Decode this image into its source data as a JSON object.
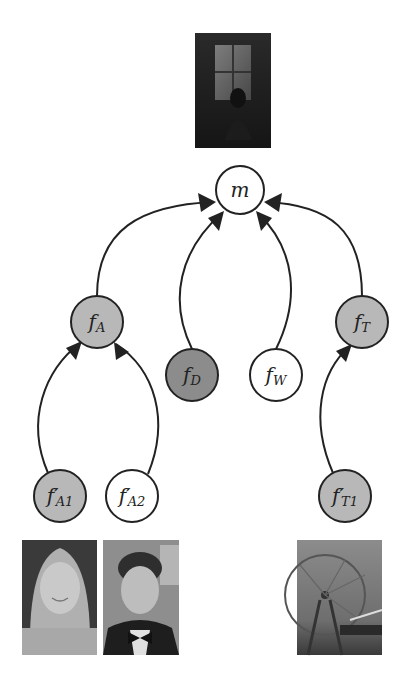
{
  "diagram": {
    "type": "tree-graphical-model",
    "colors": {
      "node_stroke": "#222222",
      "edge": "#222222",
      "node_white": "#ffffff",
      "node_light_gray": "#b8b8b8",
      "node_dark_gray": "#8c8c8c"
    },
    "nodes": [
      {
        "id": "m",
        "label": "m",
        "sub": "",
        "prime": false,
        "cx": 240,
        "cy": 190,
        "r": 24,
        "fill": "#ffffff"
      },
      {
        "id": "fA",
        "label": "f",
        "sub": "A",
        "prime": false,
        "cx": 97,
        "cy": 322,
        "r": 26,
        "fill": "#b8b8b8"
      },
      {
        "id": "fD",
        "label": "f",
        "sub": "D",
        "prime": false,
        "cx": 192,
        "cy": 375,
        "r": 26,
        "fill": "#8c8c8c"
      },
      {
        "id": "fW",
        "label": "f",
        "sub": "W",
        "prime": false,
        "cx": 276,
        "cy": 375,
        "r": 26,
        "fill": "#ffffff"
      },
      {
        "id": "fT",
        "label": "f",
        "sub": "T",
        "prime": false,
        "cx": 362,
        "cy": 322,
        "r": 26,
        "fill": "#b8b8b8"
      },
      {
        "id": "fA1",
        "label": "f",
        "sub": "A1",
        "prime": true,
        "cx": 60,
        "cy": 496,
        "r": 26,
        "fill": "#b8b8b8"
      },
      {
        "id": "fA2",
        "label": "f",
        "sub": "A2",
        "prime": true,
        "cx": 132,
        "cy": 496,
        "r": 26,
        "fill": "#ffffff"
      },
      {
        "id": "fT1",
        "label": "f",
        "sub": "T1",
        "prime": true,
        "cx": 345,
        "cy": 496,
        "r": 26,
        "fill": "#b8b8b8"
      }
    ],
    "edges": [
      {
        "from": "fA",
        "to": "m",
        "path": "M 97 296 C 97 230, 140 205, 214 202",
        "arrow": [
          216,
          202,
          198,
          193,
          201,
          212
        ]
      },
      {
        "from": "fD",
        "to": "m",
        "path": "M 192 349 C 168 300, 180 250, 222 213",
        "arrow": [
          224,
          211,
          208,
          218,
          219,
          231
        ]
      },
      {
        "from": "fW",
        "to": "m",
        "path": "M 276 349 C 300 300, 296 250, 258 213",
        "arrow": [
          256,
          211,
          261,
          231,
          272,
          218
        ]
      },
      {
        "from": "fT",
        "to": "m",
        "path": "M 362 296 C 362 230, 330 205, 266 202",
        "arrow": [
          264,
          202,
          279,
          212,
          282,
          193
        ]
      },
      {
        "from": "fA1",
        "to": "fA",
        "path": "M 48 473 C 25 420, 45 370, 80 343",
        "arrow": [
          82,
          341,
          66,
          348,
          76,
          360
        ]
      },
      {
        "from": "fA2",
        "to": "fA",
        "path": "M 148 474 C 170 420, 155 370, 116 344",
        "arrow": [
          114,
          342,
          116,
          360,
          129,
          352
        ]
      },
      {
        "from": "fT1",
        "to": "fT",
        "path": "M 333 473 C 310 420, 320 372, 350 346",
        "arrow": [
          352,
          344,
          336,
          351,
          346,
          362
        ]
      }
    ],
    "images": [
      {
        "id": "movie-poster",
        "caption": "movie poster (woman seated by a window)",
        "x": 195,
        "y": 33,
        "w": 76,
        "h": 115,
        "tone": "dark"
      },
      {
        "id": "actress-photo",
        "caption": "photo of actress",
        "x": 22,
        "y": 540,
        "w": 75,
        "h": 115,
        "tone": "light"
      },
      {
        "id": "actor-photo",
        "caption": "photo of actor in tuxedo",
        "x": 103,
        "y": 540,
        "w": 76,
        "h": 115,
        "tone": "mid"
      },
      {
        "id": "theme-photo",
        "caption": "photo of ferris wheel",
        "x": 297,
        "y": 540,
        "w": 85,
        "h": 115,
        "tone": "mid"
      }
    ]
  }
}
